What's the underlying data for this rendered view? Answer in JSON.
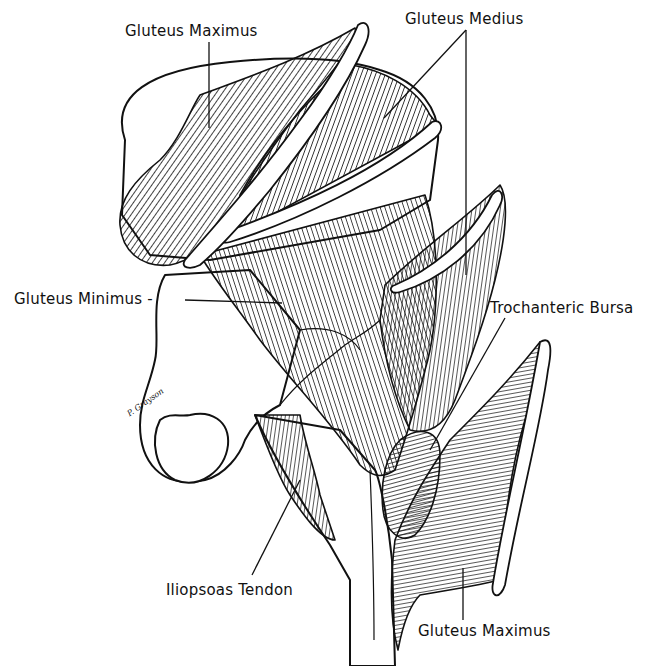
{
  "figure": {
    "colors": {
      "ink": "#111111",
      "background": "#ffffff"
    },
    "artist_signature": "P. Grayson"
  },
  "labels": [
    {
      "id": "gluteus-maximus-top",
      "text": "Gluteus Maximus",
      "x": 125,
      "y": 22
    },
    {
      "id": "gluteus-medius",
      "text": "Gluteus Medius",
      "x": 405,
      "y": 10
    },
    {
      "id": "gluteus-minimus",
      "text": "Gluteus Minimus -",
      "x": 14,
      "y": 290
    },
    {
      "id": "trochanteric-bursa",
      "text": "Trochanteric Bursa",
      "x": 490,
      "y": 299
    },
    {
      "id": "iliopsoas-tendon",
      "text": "Iliopsoas Tendon",
      "x": 166,
      "y": 581
    },
    {
      "id": "gluteus-maximus-bottom",
      "text": "Gluteus Maximus",
      "x": 418,
      "y": 622
    }
  ]
}
